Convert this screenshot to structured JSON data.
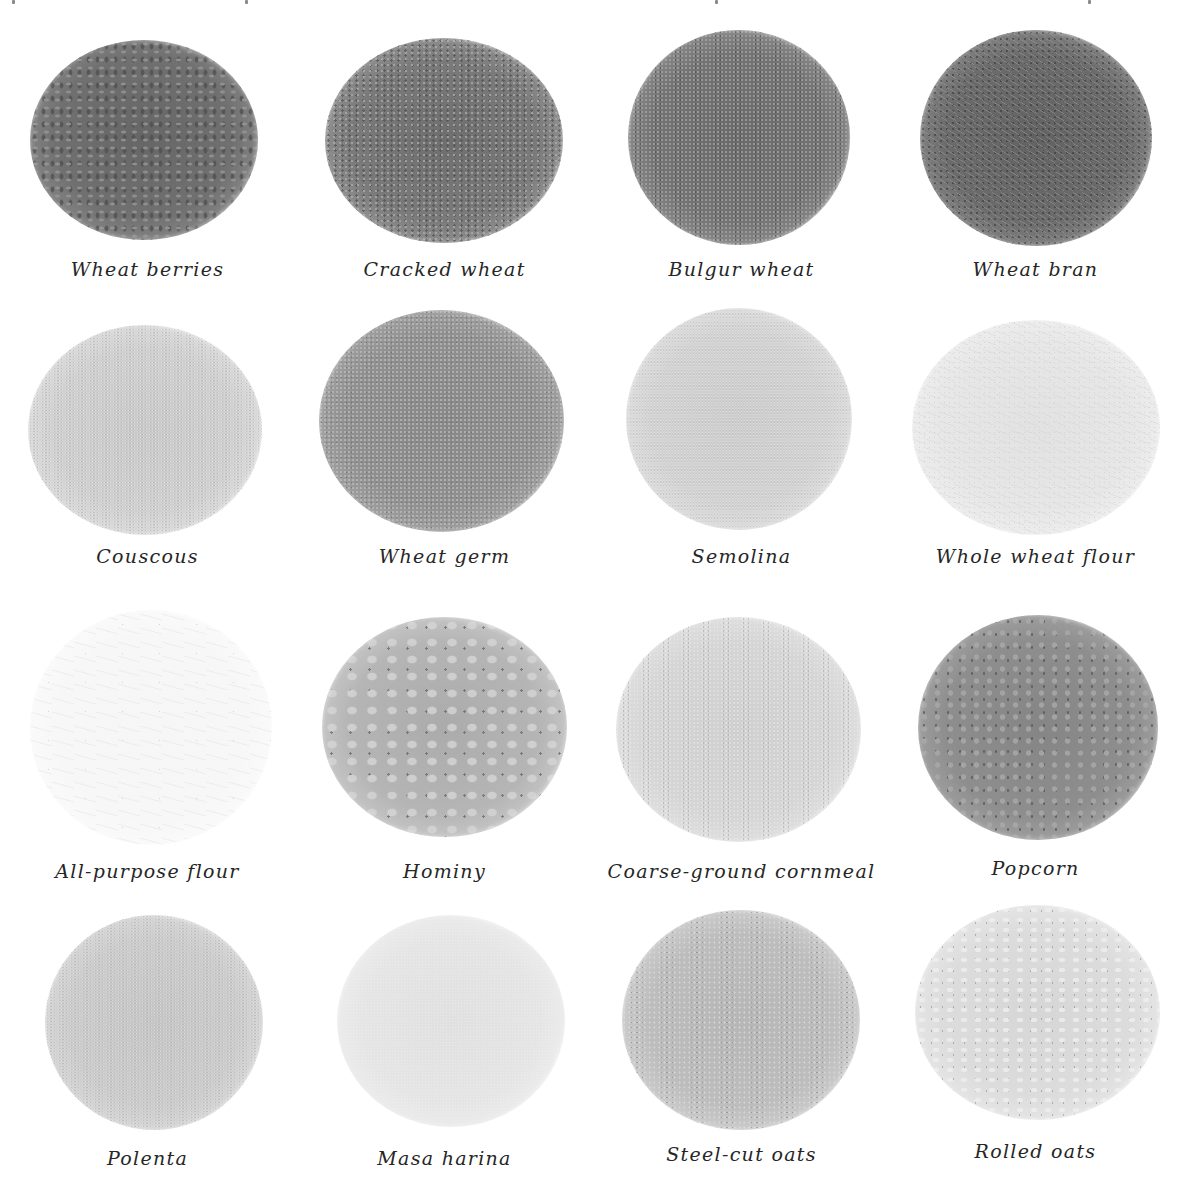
{
  "page": {
    "background": "#ffffff",
    "caption_color": "#262626"
  },
  "grains": [
    {
      "label": "Wheat berries",
      "tone": "#6e6e6e",
      "edge": "#8a8a8a",
      "grain": "coarse-kernels"
    },
    {
      "label": "Cracked wheat",
      "tone": "#7a7a7a",
      "edge": "#969696",
      "grain": "cracked"
    },
    {
      "label": "Bulgur wheat",
      "tone": "#727272",
      "edge": "#8e8e8e",
      "grain": "fine-cracked"
    },
    {
      "label": "Wheat bran",
      "tone": "#6a6a6a",
      "edge": "#888888",
      "grain": "flakes"
    },
    {
      "label": "Couscous",
      "tone": "#cfcfcf",
      "edge": "#dedede",
      "grain": "fine-pellets"
    },
    {
      "label": "Wheat germ",
      "tone": "#8f8f8f",
      "edge": "#a6a6a6",
      "grain": "fine-flakes"
    },
    {
      "label": "Semolina",
      "tone": "#d2d2d2",
      "edge": "#e0e0e0",
      "grain": "powder"
    },
    {
      "label": "Whole wheat flour",
      "tone": "#e6e6e6",
      "edge": "#efefef",
      "grain": "flour"
    },
    {
      "label": "All-purpose flour",
      "tone": "#f7f7f7",
      "edge": "#fbfbfb",
      "grain": "flour"
    },
    {
      "label": "Hominy",
      "tone": "#b4b4b4",
      "edge": "#cacaca",
      "grain": "large-kernels"
    },
    {
      "label": "Coarse-ground cornmeal",
      "tone": "#d4d4d4",
      "edge": "#e2e2e2",
      "grain": "coarse-meal"
    },
    {
      "label": "Popcorn",
      "tone": "#8c8c8c",
      "edge": "#a4a4a4",
      "grain": "round-kernels"
    },
    {
      "label": "Polenta",
      "tone": "#cbcbcb",
      "edge": "#dadada",
      "grain": "powder"
    },
    {
      "label": "Masa harina",
      "tone": "#e4e4e4",
      "edge": "#eeeeee",
      "grain": "flour"
    },
    {
      "label": "Steel-cut oats",
      "tone": "#bcbcbc",
      "edge": "#d0d0d0",
      "grain": "chips"
    },
    {
      "label": "Rolled oats",
      "tone": "#dcdcdc",
      "edge": "#e8e8e8",
      "grain": "large-flakes"
    }
  ]
}
